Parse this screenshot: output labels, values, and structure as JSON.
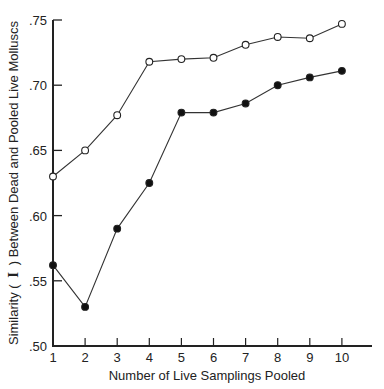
{
  "chart_data": {
    "type": "line",
    "title": "",
    "xlabel": "Number of Live Samplings Pooled",
    "ylabel": "Similarity ( I ) Between Dead and Pooled Live Molluscs",
    "x": [
      1,
      2,
      3,
      4,
      5,
      6,
      7,
      8,
      9,
      10
    ],
    "xticks": [
      "1",
      "2",
      "3",
      "4",
      "5",
      "6",
      "7",
      "8",
      "9",
      "10"
    ],
    "yticks": [
      ".50",
      ".55",
      ".60",
      ".65",
      ".70",
      ".75"
    ],
    "ylim": [
      0.5,
      0.75
    ],
    "grid": false,
    "legend": "none",
    "series": [
      {
        "name": "open-circles",
        "marker": "open-circle",
        "values": [
          0.63,
          0.65,
          0.677,
          0.718,
          0.72,
          0.721,
          0.731,
          0.737,
          0.736,
          0.747
        ]
      },
      {
        "name": "filled-circles",
        "marker": "filled-circle",
        "values": [
          0.562,
          0.53,
          0.59,
          0.625,
          0.679,
          0.679,
          0.686,
          0.7,
          0.706,
          0.711
        ]
      }
    ]
  },
  "labels": {
    "xlabel": "Number of Live Samplings Pooled",
    "ylabel_pre": "Similarity (",
    "ylabel_sym": "I",
    "ylabel_post": ") Between Dead and Pooled Live Molluscs"
  }
}
